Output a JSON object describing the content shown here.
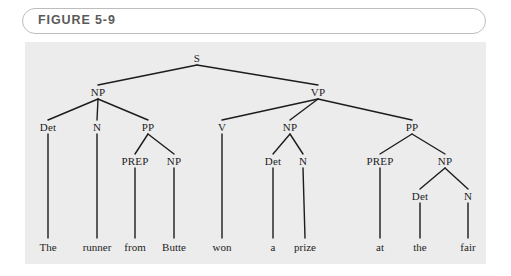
{
  "figure": {
    "label": "FIGURE 5-9"
  },
  "colors": {
    "panel_background": "#ececed",
    "page_background": "#ffffff",
    "capsule_border": "#bdbdbd",
    "caption_text": "#5a5a5a",
    "tree_line": "#1c1c1c",
    "node_text": "#1c1c1c"
  },
  "tree": {
    "sentence": "The runner from Butte won a prize at the fair",
    "nodes": [
      {
        "id": "s",
        "label": "S",
        "x": 197,
        "y": 58
      },
      {
        "id": "np1",
        "label": "NP",
        "x": 98,
        "y": 92
      },
      {
        "id": "vp",
        "label": "VP",
        "x": 318,
        "y": 92
      },
      {
        "id": "det1",
        "label": "Det",
        "x": 48,
        "y": 127
      },
      {
        "id": "n1",
        "label": "N",
        "x": 97,
        "y": 127
      },
      {
        "id": "pp1",
        "label": "PP",
        "x": 148,
        "y": 127
      },
      {
        "id": "v",
        "label": "V",
        "x": 222,
        "y": 127
      },
      {
        "id": "np2",
        "label": "NP",
        "x": 290,
        "y": 127
      },
      {
        "id": "pp2",
        "label": "PP",
        "x": 412,
        "y": 127
      },
      {
        "id": "prep1",
        "label": "PREP",
        "x": 135,
        "y": 161
      },
      {
        "id": "np3",
        "label": "NP",
        "x": 174,
        "y": 161
      },
      {
        "id": "det2",
        "label": "Det",
        "x": 273,
        "y": 161
      },
      {
        "id": "n2",
        "label": "N",
        "x": 303,
        "y": 161
      },
      {
        "id": "prep2",
        "label": "PREP",
        "x": 380,
        "y": 161
      },
      {
        "id": "np4",
        "label": "NP",
        "x": 445,
        "y": 161
      },
      {
        "id": "det3",
        "label": "Det",
        "x": 420,
        "y": 196
      },
      {
        "id": "n3",
        "label": "N",
        "x": 468,
        "y": 196
      }
    ],
    "leaves": [
      {
        "id": "w-the",
        "label": "The",
        "x": 48,
        "y": 247,
        "parent": "det1"
      },
      {
        "id": "w-runner",
        "label": "runner",
        "x": 97,
        "y": 247,
        "parent": "n1"
      },
      {
        "id": "w-from",
        "label": "from",
        "x": 135,
        "y": 247,
        "parent": "prep1"
      },
      {
        "id": "w-butte",
        "label": "Butte",
        "x": 174,
        "y": 247,
        "parent": "np3"
      },
      {
        "id": "w-won",
        "label": "won",
        "x": 222,
        "y": 247,
        "parent": "v"
      },
      {
        "id": "w-a",
        "label": "a",
        "x": 273,
        "y": 247,
        "parent": "det2"
      },
      {
        "id": "w-prize",
        "label": "prize",
        "x": 305,
        "y": 247,
        "parent": "n2"
      },
      {
        "id": "w-at",
        "label": "at",
        "x": 380,
        "y": 247,
        "parent": "prep2"
      },
      {
        "id": "w-the2",
        "label": "the",
        "x": 420,
        "y": 247,
        "parent": "det3"
      },
      {
        "id": "w-fair",
        "label": "fair",
        "x": 468,
        "y": 247,
        "parent": "n3"
      }
    ],
    "edges": [
      {
        "from": "s",
        "to": "np1"
      },
      {
        "from": "s",
        "to": "vp"
      },
      {
        "from": "np1",
        "to": "det1"
      },
      {
        "from": "np1",
        "to": "n1"
      },
      {
        "from": "np1",
        "to": "pp1"
      },
      {
        "from": "vp",
        "to": "v"
      },
      {
        "from": "vp",
        "to": "np2"
      },
      {
        "from": "vp",
        "to": "pp2"
      },
      {
        "from": "pp1",
        "to": "prep1"
      },
      {
        "from": "pp1",
        "to": "np3"
      },
      {
        "from": "np2",
        "to": "det2"
      },
      {
        "from": "np2",
        "to": "n2"
      },
      {
        "from": "pp2",
        "to": "prep2"
      },
      {
        "from": "pp2",
        "to": "np4"
      },
      {
        "from": "np4",
        "to": "det3"
      },
      {
        "from": "np4",
        "to": "n3"
      }
    ]
  }
}
